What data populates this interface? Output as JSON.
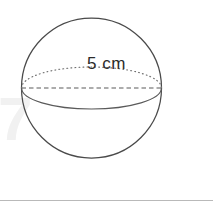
{
  "figure": {
    "kind": "sphere-diagram",
    "label": "5 cm",
    "measurement": {
      "value": "5",
      "unit": "cm",
      "quantity": "diameter"
    },
    "background_color": "#ffffff",
    "outline_color": "#4a4a4a",
    "equator_color": "#6a6a6a",
    "label_color": "#2b2b2b",
    "divider_color": "#b9b9b9",
    "watermark_color": "#f0f0f0",
    "watermark_text": "7",
    "parts": {
      "outline_name": "sphere-outline-circle",
      "back_arc_name": "equator-back-arc-dotted",
      "diameter_name": "diameter-dashed-line",
      "front_arc_name": "equator-front-arc-solid"
    }
  }
}
